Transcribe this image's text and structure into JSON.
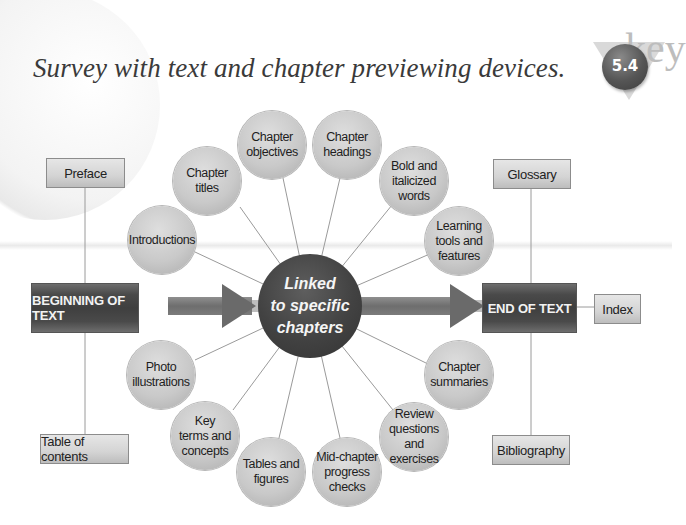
{
  "title": "Survey with text and chapter previewing devices.",
  "badge": {
    "label": "5.4",
    "watermark": "key"
  },
  "hub": {
    "label": "Linked\nto specific\nchapters"
  },
  "flow": {
    "start_label": "BEGINNING OF TEXT",
    "end_label": "END OF TEXT"
  },
  "boxes": {
    "preface": "Preface",
    "table_of_contents": "Table of contents",
    "glossary": "Glossary",
    "index": "Index",
    "bibliography": "Bibliography"
  },
  "circles": [
    {
      "id": "introductions",
      "label": "Introductions"
    },
    {
      "id": "chapter-titles",
      "label": "Chapter\ntitles"
    },
    {
      "id": "chapter-objectives",
      "label": "Chapter\nobjectives"
    },
    {
      "id": "chapter-headings",
      "label": "Chapter\nheadings"
    },
    {
      "id": "bold-italicized-words",
      "label": "Bold and\nitalicized\nwords"
    },
    {
      "id": "learning-tools",
      "label": "Learning\ntools and\nfeatures"
    },
    {
      "id": "chapter-summaries",
      "label": "Chapter\nsummaries"
    },
    {
      "id": "review-questions",
      "label": "Review\nquestions and\nexercises"
    },
    {
      "id": "mid-chapter-checks",
      "label": "Mid-chapter\nprogress\nchecks"
    },
    {
      "id": "tables-figures",
      "label": "Tables and\nfigures"
    },
    {
      "id": "key-terms",
      "label": "Key\nterms and\nconcepts"
    },
    {
      "id": "photo-illustrations",
      "label": "Photo\nillustrations"
    }
  ]
}
